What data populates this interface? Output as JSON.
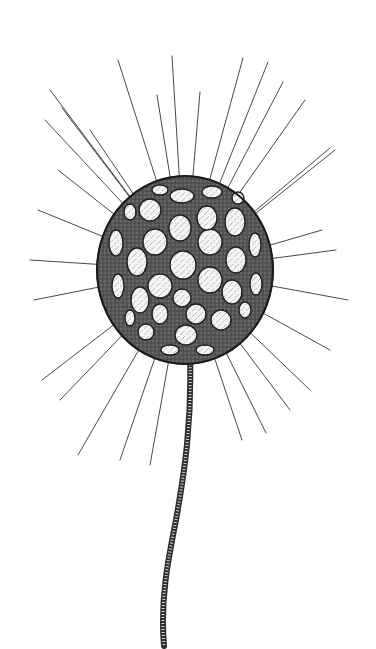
{
  "image": {
    "subject": "engraving of a stalked lattice-shelled protist with radiating spines",
    "background": "#ffffff",
    "ink": "#2b2b2b",
    "shell": {
      "cx": 185,
      "cy": 270,
      "rx": 86,
      "ry": 92,
      "fill": "#4a4a4a"
    },
    "stalk": {
      "color": "#3a3a3a"
    }
  }
}
